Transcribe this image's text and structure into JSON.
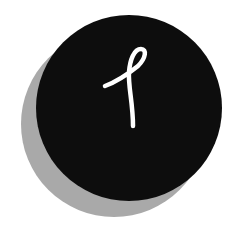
{
  "logo": {
    "glyph": "ℓ",
    "colors": {
      "background": "#ffffff",
      "circle": "#0d0d0d",
      "shadow": "#a9a9a9",
      "glyph": "#ffffff"
    }
  }
}
